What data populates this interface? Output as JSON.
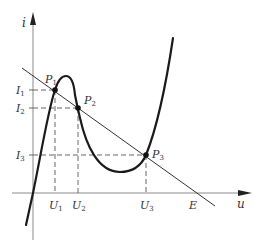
{
  "diagram": {
    "type": "tunnel-diode-iv-characteristic-with-load-line",
    "axes": {
      "x_label": "u",
      "y_label": "i"
    },
    "operating_points": [
      {
        "label": "P",
        "sub": "1"
      },
      {
        "label": "P",
        "sub": "2"
      },
      {
        "label": "P",
        "sub": "3"
      }
    ],
    "current_levels": [
      {
        "label": "I",
        "sub": "1"
      },
      {
        "label": "I",
        "sub": "2"
      },
      {
        "label": "I",
        "sub": "3"
      }
    ],
    "voltage_levels": [
      {
        "label": "U",
        "sub": "1"
      },
      {
        "label": "U",
        "sub": "2"
      },
      {
        "label": "U",
        "sub": "3"
      }
    ],
    "load_line_intercept": "E",
    "colors": {
      "curve": "#1a1a1a",
      "axis": "#888888",
      "dashed": "#555555",
      "text": "#333333"
    }
  }
}
